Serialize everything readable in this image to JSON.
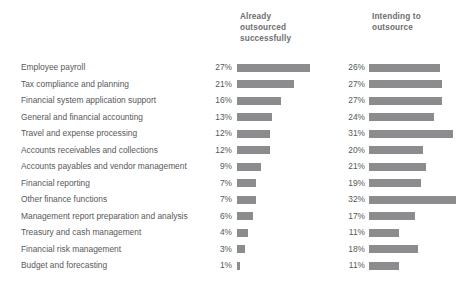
{
  "columns": {
    "col1_header": "Already\noutsourced\nsuccessfully",
    "col2_header": "Intending to\noutsource"
  },
  "colors": {
    "bar": "#8c8c8e",
    "text": "#58585a",
    "header_text": "#6d6e70",
    "background": "#ffffff"
  },
  "chart_data": {
    "type": "bar",
    "title": "",
    "subtitle": "",
    "xlabel": "",
    "ylabel": "",
    "grid": false,
    "legend_position": "top",
    "orientation": "horizontal",
    "axis_range": [
      0,
      35
    ],
    "value_suffix": "%",
    "px_per_percent": 2.72,
    "categories": [
      "Employee payroll",
      "Tax compliance and planning",
      "Financial system application support",
      "General and financial accounting",
      "Travel and expense processing",
      "Accounts receivables and collections",
      "Accounts payables and vendor management",
      "Financial reporting",
      "Other finance functions",
      "Management report preparation and analysis",
      "Treasury and cash management",
      "Financial risk management",
      "Budget and forecasting"
    ],
    "series": [
      {
        "name": "Already outsourced successfully",
        "values": [
          27,
          21,
          16,
          13,
          12,
          12,
          9,
          7,
          7,
          6,
          4,
          3,
          1
        ],
        "labels": [
          "27%",
          "21%",
          "16%",
          "13%",
          "12%",
          "12%",
          "9%",
          "7%",
          "7%",
          "6%",
          "4%",
          "3%",
          "1%"
        ]
      },
      {
        "name": "Intending to outsource",
        "values": [
          26,
          27,
          27,
          24,
          31,
          20,
          21,
          19,
          32,
          17,
          11,
          18,
          11
        ],
        "labels": [
          "26%",
          "27%",
          "27%",
          "24%",
          "31%",
          "20%",
          "21%",
          "19%",
          "32%",
          "17%",
          "11%",
          "18%",
          "11%"
        ]
      }
    ]
  }
}
